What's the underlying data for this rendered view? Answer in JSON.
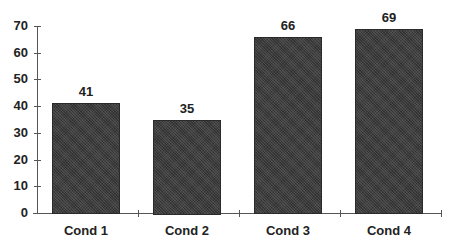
{
  "chart_data": {
    "type": "bar",
    "title": "",
    "xlabel": "",
    "ylabel": "",
    "categories": [
      "Cond 1",
      "Cond 2",
      "Cond 3",
      "Cond 4"
    ],
    "values": [
      41,
      35,
      66,
      69
    ],
    "value_labels": [
      "41",
      "35",
      "66",
      "69"
    ],
    "ylim": [
      0,
      70
    ],
    "yticks": [
      0,
      10,
      20,
      30,
      40,
      50,
      60,
      70
    ],
    "ytick_labels": [
      "0",
      "10",
      "20",
      "30",
      "40",
      "50",
      "60",
      "70"
    ],
    "grid": false,
    "legend": null,
    "bar_color": "#3c3c3c"
  }
}
